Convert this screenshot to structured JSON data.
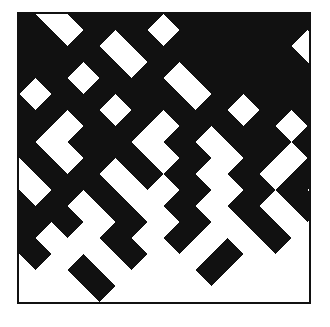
{
  "artwork": {
    "title": "Diagonal Lattice Composition",
    "medium": "abstract geometric print",
    "canvas": {
      "width": 330,
      "height": 327,
      "background_color": "#ffffff"
    },
    "frame": {
      "label": "square border frame",
      "x": 17,
      "y": 12,
      "width": 294,
      "height": 292,
      "stroke_color": "#111111",
      "stroke_width": 2,
      "fill_color": "#ffffff"
    },
    "pattern": {
      "label": "rotated-square lattice gradient",
      "shape": "diamond",
      "rotation_degrees": 45,
      "ink_color": "#111111",
      "paper_color": "#ffffff",
      "cell_pitch": 16,
      "cell_half_diagonal": 16,
      "origin_x": -16,
      "origin_y": -16,
      "columns": 20,
      "rows": 20,
      "density_description": "dense black at upper-left, fading to empty white at lower-right",
      "grid": [
        "11111111111111111111",
        "10111111111111111111",
        "11011011111111011110",
        "11101111101111101101",
        "11110111110111011011",
        "11011011111011101110",
        "10111101111110110111",
        "11101110111101101010",
        "11011011101011010100",
        "10110101110110101000",
        "11011010101101010100",
        "01101101011010100000",
        "10110010110101010000",
        "11010101011010000000",
        "01101010100100100000",
        "10010100101000000000",
        "01001001000000000000",
        "00100010000000000000",
        "00010000000000000000",
        "00000000000000000000"
      ]
    }
  }
}
